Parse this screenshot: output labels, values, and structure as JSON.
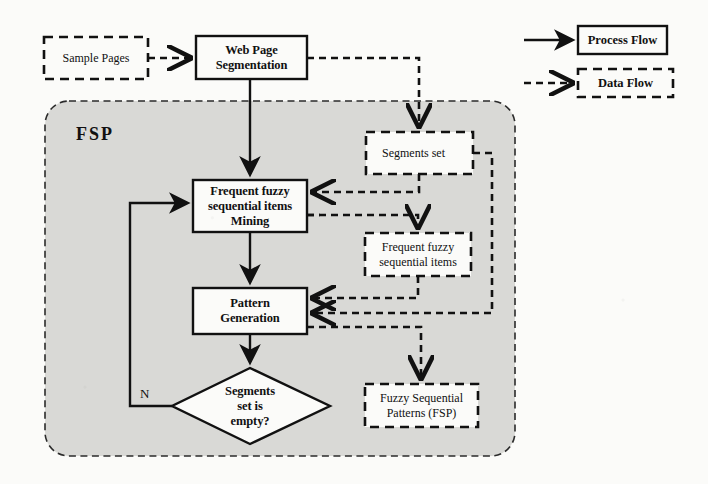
{
  "figure": {
    "type": "flowchart",
    "container": {
      "title": "FSP",
      "style": "dashed-rounded-shaded"
    },
    "nodes": [
      {
        "id": "sample-pages",
        "label": "Sample Pages",
        "shape": "rectangle",
        "border": "dashed",
        "role": "data"
      },
      {
        "id": "web-page-segmentation",
        "label": "Web Page\nSegmentation",
        "line1": "Web Page",
        "line2": "Segmentation",
        "shape": "rectangle",
        "border": "solid",
        "role": "process"
      },
      {
        "id": "segments-set",
        "label": "Segments set",
        "shape": "rectangle",
        "border": "dashed",
        "role": "data"
      },
      {
        "id": "frequent-fuzzy-sequential-items-mining",
        "line1": "Frequent fuzzy",
        "line2": "sequential items",
        "line3": "Mining",
        "shape": "rectangle",
        "border": "solid",
        "role": "process"
      },
      {
        "id": "frequent-fuzzy-sequential-items",
        "line1": "Frequent fuzzy",
        "line2": "sequential items",
        "shape": "rectangle",
        "border": "dashed",
        "role": "data"
      },
      {
        "id": "pattern-generation",
        "line1": "Pattern",
        "line2": "Generation",
        "shape": "rectangle",
        "border": "solid",
        "role": "process"
      },
      {
        "id": "segments-set-is-empty",
        "line1": "Segments",
        "line2": "set is",
        "line3": "empty?",
        "shape": "diamond",
        "border": "solid",
        "role": "decision"
      },
      {
        "id": "fuzzy-sequential-patterns",
        "line1": "Fuzzy Sequential",
        "line2": "Patterns (FSP)",
        "shape": "rectangle",
        "border": "dashed",
        "role": "data"
      }
    ],
    "edge_labels": {
      "decision_no": "N"
    }
  },
  "legend": {
    "items": [
      {
        "id": "process-flow",
        "label": "Process Flow",
        "line": "solid"
      },
      {
        "id": "data-flow",
        "label": "Data Flow",
        "line": "dashed"
      }
    ]
  },
  "colors": {
    "stroke": "#111111",
    "container_fill": "#d9d9d6",
    "node_fill": "#fbfbf9",
    "page_background": "#fbfbf9"
  }
}
